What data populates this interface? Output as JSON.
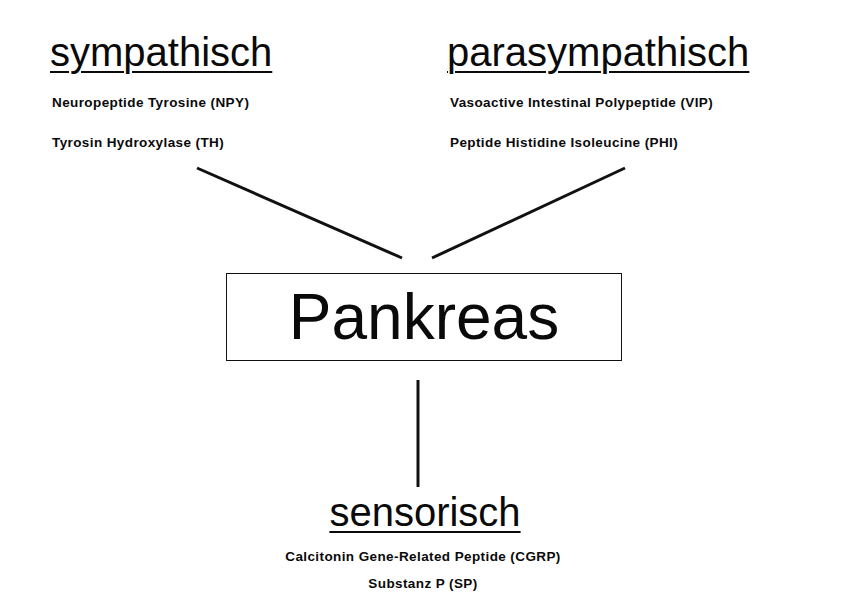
{
  "diagram": {
    "center": {
      "label": "Pankreas"
    },
    "nodes": [
      {
        "id": "sympathetic",
        "title": "sympathisch",
        "items": [
          "Neuropeptide Tyrosine (NPY)",
          "Tyrosin Hydroxylase (TH)"
        ]
      },
      {
        "id": "parasympathetic",
        "title": "parasympathisch",
        "items": [
          "Vasoactive Intestinal Polypeptide (VIP)",
          "Peptide Histidine Isoleucine (PHI)"
        ]
      },
      {
        "id": "sensory",
        "title": "sensorisch",
        "items": [
          "Calcitonin Gene-Related Peptide (CGRP)",
          "Substanz P (SP)"
        ]
      }
    ],
    "edges": [
      {
        "from": "sympathetic",
        "to": "center"
      },
      {
        "from": "parasympathetic",
        "to": "center"
      },
      {
        "from": "center",
        "to": "sensory"
      }
    ],
    "colors": {
      "line": "#111111",
      "text": "#0a0a0a",
      "background": "#ffffff"
    }
  }
}
